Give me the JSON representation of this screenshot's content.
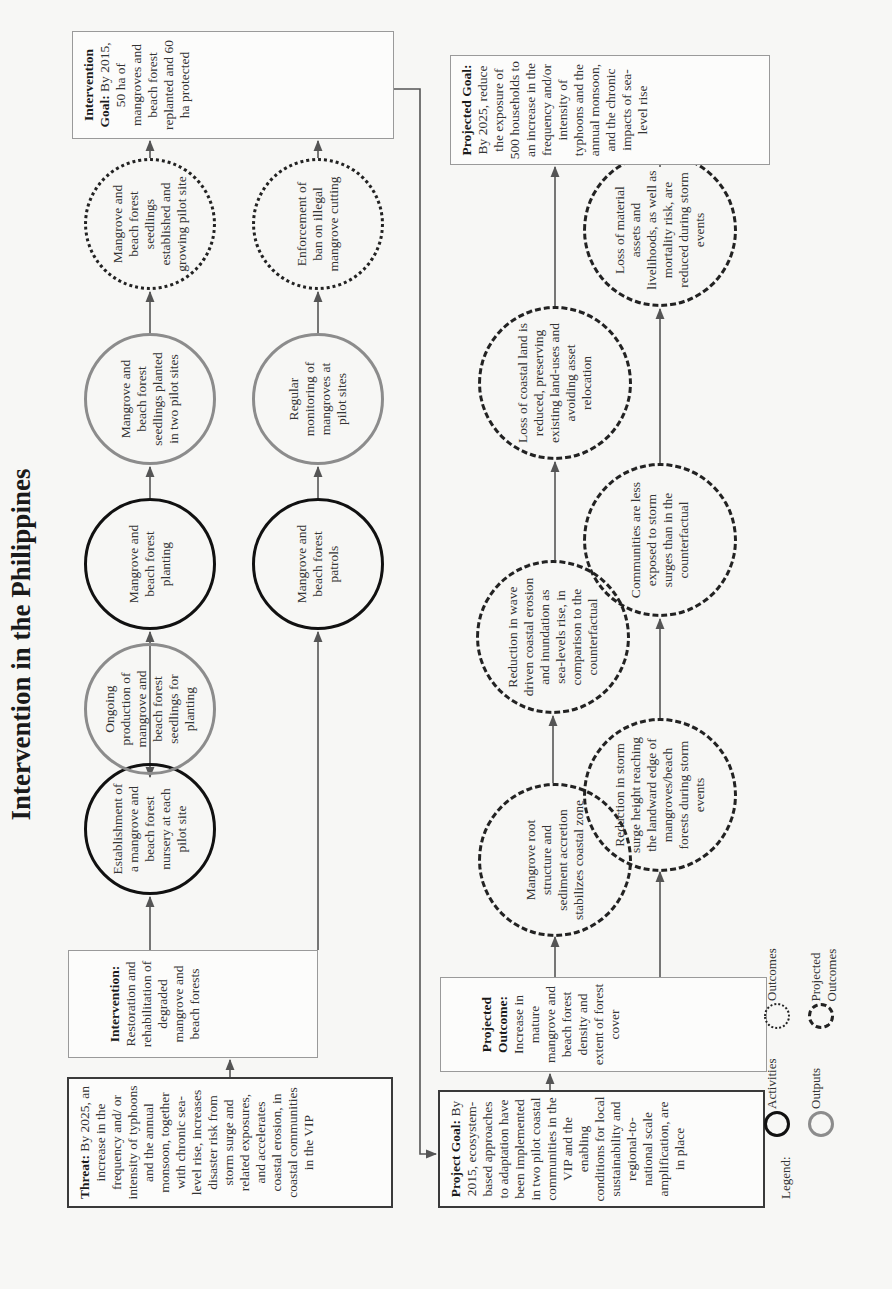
{
  "title": "Intervention in the Philippines",
  "threat": {
    "label": "Threat:",
    "text": "By 2025, an increase in the frequency and/ or intensity of typhoons and the annual monsoon, together with chronic sea-level rise, increases disaster risk from storm surge and related exposures, and accelerates coastal erosion, in coastal communities in the VIP"
  },
  "intervention": {
    "label": "Intervention:",
    "text": "Restoration and rehabilitation of degraded mangrove and beach forests"
  },
  "row1": [
    {
      "type": "activity",
      "text": "Establishment of a mangrove and beach forest nursery at each pilot site"
    },
    {
      "type": "output",
      "text": "Ongoing production of mangrove and beach forest seedlings for planting"
    },
    {
      "type": "activity",
      "text": "Mangrove and beach forest planting"
    },
    {
      "type": "output",
      "text": "Mangrove and beach forest seedlings planted in two pilot sites"
    },
    {
      "type": "outcome",
      "text": "Mangrove and beach forest seedlings established and growing pilot site"
    }
  ],
  "row2": [
    {
      "type": "activity",
      "text": "Mangrove and beach forest patrols"
    },
    {
      "type": "output",
      "text": "Regular monitoring of mangroves at pilot sites"
    },
    {
      "type": "outcome",
      "text": "Enforcement of ban on illegal mangrove cutting"
    }
  ],
  "intervention_goal": {
    "label": "Intervention Goal:",
    "text": "By 2015, 50 ha of mangroves and beach forest replanted and 60 ha protected"
  },
  "project_goal": {
    "label": "Project Goal:",
    "text": "By 2015, ecosystem-based approaches to adaptation have been implemented in two pilot coastal communities in the VIP and the enabling conditions for local sustainability and regional-to-national scale amplification, are in place"
  },
  "projected_outcome": {
    "label": "Projected Outcome:",
    "text": "Increase in mature mangrove and beach forest density and extent of forest cover"
  },
  "projected_upper": [
    {
      "type": "projected",
      "text": "Mangrove root structure and sediment accretion stabilizes coastal zone"
    },
    {
      "type": "projected",
      "text": "Reduction in wave driven coastal erosion and inundation as sea-levels rise, in comparison to the counterfactual"
    },
    {
      "type": "projected",
      "text": "Loss of coastal land is reduced, preserving existing land-uses and avoiding asset relocation"
    }
  ],
  "projected_lower": [
    {
      "type": "projected",
      "text": "Reduction in storm surge height reaching the landward edge of mangroves/beach forests during storm events"
    },
    {
      "type": "projected",
      "text": "Communities are less exposed to storm surges than in the counterfactual"
    },
    {
      "type": "projected",
      "text": "Loss of material assets and livelihoods, as well as mortality risk, are reduced during storm events"
    }
  ],
  "projected_goal": {
    "label": "Projected Goal:",
    "text": "By 2025, reduce the exposure of 500 households to an increase in the frequency and/or intensity of typhoons and the annual monsoon, and the chronic impacts of sea-level rise"
  },
  "legend": {
    "label": "Legend:",
    "activities": "Activities",
    "outputs": "Outputs",
    "outcomes": "Outcomes",
    "projected_outcomes": "Projected Outcomes"
  },
  "colors": {
    "activity": "#111111",
    "output": "#8c8c8c",
    "line": "#555555",
    "background": "#f7f7f5"
  }
}
